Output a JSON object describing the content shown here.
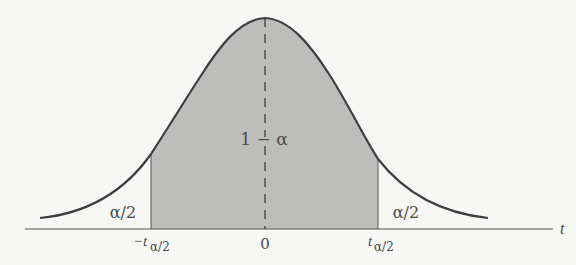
{
  "diagram": {
    "type": "t-distribution-two-tailed",
    "colors": {
      "background": "#f7f7f5",
      "curve": "#3e3e3e",
      "shaded_region": "#bdbdbb",
      "axis": "#555555",
      "text": "#4a4a4a"
    },
    "labels": {
      "center_region": "1 − α",
      "left_tail": "α/2",
      "right_tail": "α/2",
      "axis_variable": "t",
      "tick_left_main": "−t",
      "tick_left_sub": "α/2",
      "tick_center": "0",
      "tick_right_main": "t",
      "tick_right_sub": "α/2"
    }
  }
}
